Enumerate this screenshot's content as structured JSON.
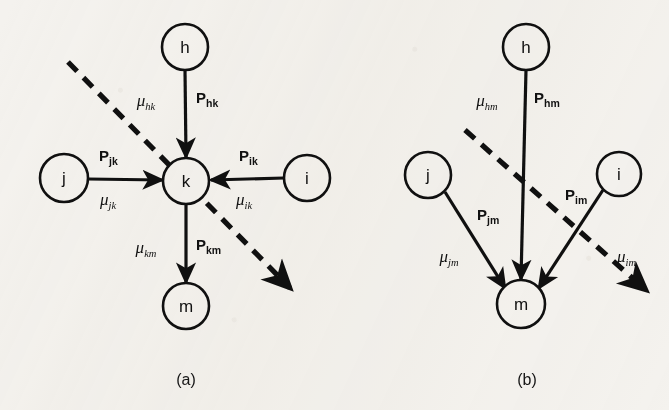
{
  "figure": {
    "type": "node-flow-diagram",
    "background_color": "#f4f2ee",
    "ink_color": "#101010",
    "panels": [
      {
        "id": "a",
        "caption": "(a)",
        "caption_x": 186,
        "caption_y": 385,
        "nodes": [
          {
            "id": "h",
            "label": "h",
            "cx": 185,
            "cy": 47,
            "r": 23
          },
          {
            "id": "j",
            "label": "j",
            "cx": 64,
            "cy": 178,
            "r": 24
          },
          {
            "id": "k",
            "label": "k",
            "cx": 186,
            "cy": 181,
            "r": 23
          },
          {
            "id": "i",
            "label": "i",
            "cx": 307,
            "cy": 178,
            "r": 23
          },
          {
            "id": "m",
            "label": "m",
            "cx": 186,
            "cy": 306,
            "r": 23
          }
        ],
        "edges": [
          {
            "id": "h-k",
            "from": "h",
            "to": "k",
            "x1": 185,
            "y1": 70,
            "x2": 186,
            "y2": 157
          },
          {
            "id": "j-k",
            "from": "j",
            "to": "k",
            "x1": 88,
            "y1": 179,
            "x2": 162,
            "y2": 180
          },
          {
            "id": "i-k",
            "from": "i",
            "to": "k",
            "x1": 284,
            "y1": 178,
            "x2": 211,
            "y2": 180
          },
          {
            "id": "k-m",
            "from": "k",
            "to": "m",
            "x1": 186,
            "y1": 204,
            "x2": 186,
            "y2": 282
          }
        ],
        "edge_labels": [
          {
            "id": "mu-hk",
            "kind": "mu",
            "base": "μ",
            "sub": "hk",
            "x": 146,
            "y": 106,
            "anchor": "middle"
          },
          {
            "id": "p-hk",
            "kind": "p",
            "base": "P",
            "sub": "hk",
            "x": 196,
            "y": 103,
            "anchor": "start"
          },
          {
            "id": "p-jk",
            "kind": "p",
            "base": "P",
            "sub": "jk",
            "x": 99,
            "y": 161,
            "anchor": "start"
          },
          {
            "id": "mu-jk",
            "kind": "mu",
            "base": "μ",
            "sub": "jk",
            "x": 100,
            "y": 205,
            "anchor": "start"
          },
          {
            "id": "p-ik",
            "kind": "p",
            "base": "P",
            "sub": "ik",
            "x": 239,
            "y": 161,
            "anchor": "start"
          },
          {
            "id": "mu-ik",
            "kind": "mu",
            "base": "μ",
            "sub": "ik",
            "x": 236,
            "y": 205,
            "anchor": "start"
          },
          {
            "id": "mu-km",
            "kind": "mu",
            "base": "μ",
            "sub": "km",
            "x": 146,
            "y": 253,
            "anchor": "middle"
          },
          {
            "id": "p-km",
            "kind": "p",
            "base": "P",
            "sub": "km",
            "x": 196,
            "y": 250,
            "anchor": "start"
          }
        ],
        "cut_line": {
          "id": "cut-a",
          "x1": 68,
          "y1": 62,
          "x2": 290,
          "y2": 288
        }
      },
      {
        "id": "b",
        "caption": "(b)",
        "caption_x": 527,
        "caption_y": 385,
        "nodes": [
          {
            "id": "h",
            "label": "h",
            "cx": 526,
            "cy": 47,
            "r": 23
          },
          {
            "id": "j",
            "label": "j",
            "cx": 428,
            "cy": 175,
            "r": 23
          },
          {
            "id": "i",
            "label": "i",
            "cx": 619,
            "cy": 174,
            "r": 22
          },
          {
            "id": "m",
            "label": "m",
            "cx": 521,
            "cy": 304,
            "r": 24
          }
        ],
        "edges": [
          {
            "id": "h-m",
            "from": "h",
            "to": "m",
            "x1": 526,
            "y1": 70,
            "x2": 521,
            "y2": 279
          },
          {
            "id": "j-m",
            "from": "j",
            "to": "m",
            "x1": 445,
            "y1": 192,
            "x2": 505,
            "y2": 288
          },
          {
            "id": "i-m",
            "from": "i",
            "to": "m",
            "x1": 603,
            "y1": 190,
            "x2": 539,
            "y2": 288
          }
        ],
        "edge_labels": [
          {
            "id": "mu-hm",
            "kind": "mu",
            "base": "μ",
            "sub": "hm",
            "x": 487,
            "y": 106,
            "anchor": "middle"
          },
          {
            "id": "p-hm",
            "kind": "p",
            "base": "P",
            "sub": "hm",
            "x": 534,
            "y": 103,
            "anchor": "start"
          },
          {
            "id": "p-jm",
            "kind": "p",
            "base": "P",
            "sub": "jm",
            "x": 477,
            "y": 220,
            "anchor": "start"
          },
          {
            "id": "mu-jm",
            "kind": "mu",
            "base": "μ",
            "sub": "jm",
            "x": 449,
            "y": 262,
            "anchor": "middle"
          },
          {
            "id": "p-im",
            "kind": "p",
            "base": "P",
            "sub": "im",
            "x": 565,
            "y": 200,
            "anchor": "start"
          },
          {
            "id": "mu-im",
            "kind": "mu",
            "base": "μ",
            "sub": "im",
            "x": 617,
            "y": 262,
            "anchor": "start"
          }
        ],
        "cut_line": {
          "id": "cut-b",
          "x1": 465,
          "y1": 130,
          "x2": 646,
          "y2": 290
        }
      }
    ]
  }
}
